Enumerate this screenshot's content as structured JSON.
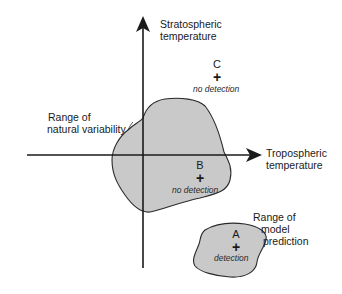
{
  "axes": {
    "y_label_line1": "Stratospheric",
    "y_label_line2": "temperature",
    "x_label_line1": "Tropospheric",
    "x_label_line2": "temperature"
  },
  "regions": {
    "natural_variability": {
      "label_line1": "Range of",
      "label_line2": "natural variability",
      "fill": "#c9c9c9"
    },
    "model_prediction": {
      "label_line1": "Range of",
      "label_line2": "model",
      "label_line3": "prediction",
      "fill": "#c9c9c9"
    }
  },
  "points": {
    "A": {
      "letter": "A",
      "marker": "+",
      "status": "detection"
    },
    "B": {
      "letter": "B",
      "marker": "+",
      "status": "no detection"
    },
    "C": {
      "letter": "C",
      "marker": "+",
      "status": "no detection"
    }
  }
}
